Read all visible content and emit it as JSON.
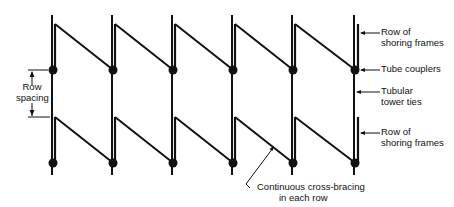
{
  "diagram": {
    "type": "shoring-frame-bracing-plan",
    "colors": {
      "ink": "#111111",
      "background": "#ffffff"
    },
    "frame_count": 6,
    "rows": 2,
    "labels": {
      "row_spacing": [
        "Row",
        "spacing"
      ],
      "top_row_frames": [
        "Row of",
        "shoring frames"
      ],
      "tube_couplers": "Tube couplers",
      "tubular_tower_ties": [
        "Tubular",
        "tower ties"
      ],
      "bottom_row_frames": [
        "Row of",
        "shoring frames"
      ],
      "cross_bracing": [
        "Continuous cross-bracing",
        "in each row"
      ]
    }
  }
}
